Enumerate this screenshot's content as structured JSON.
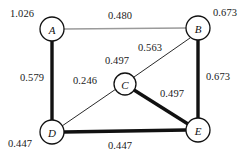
{
  "figure": {
    "type": "undirected-weighted-graph",
    "background_color": "#ffffff"
  },
  "graph_data": {
    "type": "graph",
    "nodes": [
      {
        "id": "A",
        "label": "A",
        "x": 52,
        "y": 29,
        "r": 12,
        "value": "1.026"
      },
      {
        "id": "B",
        "label": "B",
        "x": 198,
        "y": 28,
        "r": 12,
        "value": "0.673"
      },
      {
        "id": "C",
        "label": "C",
        "x": 125,
        "y": 84,
        "r": 11,
        "value": "0.497"
      },
      {
        "id": "D",
        "label": "D",
        "x": 52,
        "y": 132,
        "r": 12,
        "value": "0.447"
      },
      {
        "id": "E",
        "label": "E",
        "x": 198,
        "y": 130,
        "r": 12,
        "value": "0.447"
      }
    ],
    "edges": [
      {
        "source": "A",
        "target": "B",
        "weight": "0.480",
        "style": "thin-gray",
        "color": "#9a9a9a",
        "width": 1.6
      },
      {
        "source": "A",
        "target": "D",
        "weight": "0.579",
        "style": "thick-black",
        "color": "#111111",
        "width": 3.4
      },
      {
        "source": "B",
        "target": "C",
        "weight": "0.563",
        "style": "thin-black",
        "color": "#2a2a2a",
        "width": 1.0
      },
      {
        "source": "B",
        "target": "E",
        "weight": "0.673",
        "style": "thick-black",
        "color": "#111111",
        "width": 3.4
      },
      {
        "source": "C",
        "target": "D",
        "weight": "0.246",
        "style": "thin-black",
        "color": "#2a2a2a",
        "width": 1.0
      },
      {
        "source": "C",
        "target": "E",
        "weight": "0.497",
        "style": "thick-black",
        "color": "#111111",
        "width": 3.4
      },
      {
        "source": "D",
        "target": "E",
        "weight": "0.447",
        "style": "thick-black",
        "color": "#111111",
        "width": 3.4
      }
    ],
    "node_value_labels": [
      {
        "for": "A",
        "text": "1.026",
        "x": 10,
        "y": 8
      },
      {
        "for": "B",
        "text": "0.673",
        "x": 213,
        "y": 7
      },
      {
        "for": "D",
        "text": "0.447",
        "x": 8,
        "y": 138
      },
      {
        "for": "E",
        "text": "0.447",
        "x": 108,
        "y": 140
      }
    ],
    "edge_weight_labels": [
      {
        "for": "A-B",
        "text": "0.480",
        "x": 108,
        "y": 10
      },
      {
        "for": "A-D",
        "text": "0.579",
        "x": 20,
        "y": 72
      },
      {
        "for": "B-C",
        "text": "0.563",
        "x": 138,
        "y": 42
      },
      {
        "for": "B-E",
        "text": "0.673",
        "x": 206,
        "y": 71
      },
      {
        "for": "C-D",
        "text": "0.246",
        "x": 73,
        "y": 75
      },
      {
        "for": "C-top",
        "text": "0.497",
        "x": 105,
        "y": 55
      },
      {
        "for": "C-E",
        "text": "0.497",
        "x": 160,
        "y": 88
      }
    ]
  }
}
